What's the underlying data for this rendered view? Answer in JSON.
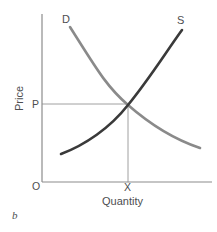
{
  "figure": {
    "letter": "b",
    "background": "#ffffff"
  },
  "chart_data": {
    "type": "line",
    "title": "",
    "xlabel": "Quantity",
    "ylabel": "Price",
    "grid": false,
    "legend": "inline-curve-labels",
    "axis_origin_label": "O",
    "xlim": [
      0,
      100
    ],
    "ylim": [
      0,
      100
    ],
    "axes": {
      "x_axis_color": "#8c8c8c",
      "y_axis_color": "#8c8c8c",
      "x_axis_pixels": {
        "x1": 42,
        "y1": 182,
        "x2": 212,
        "y2": 182
      },
      "y_axis_pixels": {
        "x1": 42,
        "y1": 14,
        "x2": 42,
        "y2": 182
      }
    },
    "series": [
      {
        "name": "D",
        "label": "D",
        "role": "demand",
        "color": "#8a8a8a",
        "slope": "downward",
        "path": "M 70,27 C 96,68 106,86 128,105 C 152,126 176,140 200,148",
        "label_position_pixels": {
          "x": 62,
          "y": 14
        }
      },
      {
        "name": "S",
        "label": "S",
        "role": "supply",
        "color": "#3a3a3a",
        "slope": "upward",
        "path": "M 61,154 C 85,145 110,128 128,105 C 150,78 166,52 182,30",
        "label_position_pixels": {
          "x": 177,
          "y": 15
        }
      }
    ],
    "equilibrium": {
      "price_label": "P",
      "quantity_label": "X",
      "point_pixels": {
        "x": 128,
        "y": 105
      },
      "guide_line_color": "#a0a0a0",
      "horizontal_guide_pixels": {
        "x1": 42,
        "y1": 104,
        "x2": 128,
        "y2": 104
      },
      "vertical_guide_pixels": {
        "x1": 128,
        "y1": 105,
        "x2": 128,
        "y2": 182
      }
    },
    "annotations": [
      {
        "text": "D",
        "meaning": "demand-curve-label"
      },
      {
        "text": "S",
        "meaning": "supply-curve-label"
      },
      {
        "text": "P",
        "meaning": "equilibrium-price-tick"
      },
      {
        "text": "X",
        "meaning": "equilibrium-quantity-tick"
      },
      {
        "text": "O",
        "meaning": "origin"
      },
      {
        "text": "Price",
        "meaning": "y-axis-title"
      },
      {
        "text": "Quantity",
        "meaning": "x-axis-title"
      },
      {
        "text": "b",
        "meaning": "figure-letter"
      }
    ]
  }
}
